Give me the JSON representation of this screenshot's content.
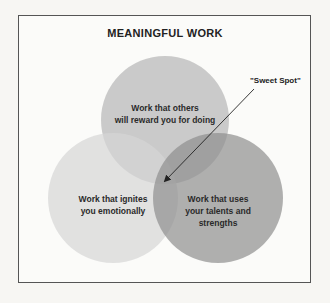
{
  "title": "MEANINGFUL WORK",
  "circles": {
    "top": {
      "label_line1": "Work that others",
      "label_line2": "will reward you for doing",
      "color": "#bdbdbd"
    },
    "left": {
      "label_line1": "Work that ignites",
      "label_line2": "you emotionally",
      "color": "#d8d8d8"
    },
    "right": {
      "label_line1": "Work that uses",
      "label_line2": "your talents and",
      "label_line3": "strengths",
      "color": "#9e9e9e"
    }
  },
  "annotation": {
    "label": "\"Sweet Spot\""
  }
}
